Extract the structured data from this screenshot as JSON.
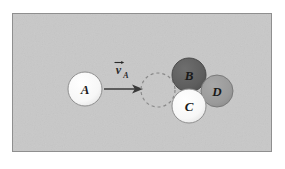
{
  "figure": {
    "panel": {
      "x": 12,
      "y": 13,
      "width": 260,
      "height": 139,
      "fill": "#c8c8c8",
      "border_color": "#8f8f8f",
      "page_background": "#ffffff"
    },
    "vector": {
      "symbol": "v",
      "subscript": "A",
      "full_label": "vA",
      "arrow": {
        "x1": 104,
        "y1": 89,
        "x2": 137,
        "y2": 89,
        "color": "#3a3a3a",
        "head_length": 11,
        "head_half_width": 4.5
      },
      "label_x": 120,
      "label_y": 72
    },
    "ghost_circle": {
      "name": "ghost-position-of-A",
      "cx": 158,
      "cy": 90,
      "r": 17,
      "stroke": "#8a8a8a",
      "dash": "3 3",
      "fill": "none"
    },
    "bodies": [
      {
        "id": "A",
        "label": "A",
        "cx": 85,
        "cy": 89,
        "r": 17,
        "fill": "#fbfbfb",
        "stroke": "#8f8f8f",
        "label_color": "#1a1a1a",
        "font_size": 13
      },
      {
        "id": "B",
        "label": "B",
        "cx": 189,
        "cy": 75,
        "r": 17,
        "fill": "#5e5e5e",
        "stroke": "#4a4a4a",
        "label_color": "#141414",
        "font_size": 13
      },
      {
        "id": "C",
        "label": "C",
        "cx": 189,
        "cy": 106,
        "r": 17,
        "fill": "#fafafa",
        "stroke": "#8f8f8f",
        "label_color": "#1a1a1a",
        "font_size": 13
      },
      {
        "id": "D",
        "label": "D",
        "cx": 217,
        "cy": 91,
        "r": 16,
        "fill": "#9b9b9b",
        "stroke": "#7a7a7a",
        "label_color": "#141414",
        "font_size": 13
      }
    ]
  }
}
